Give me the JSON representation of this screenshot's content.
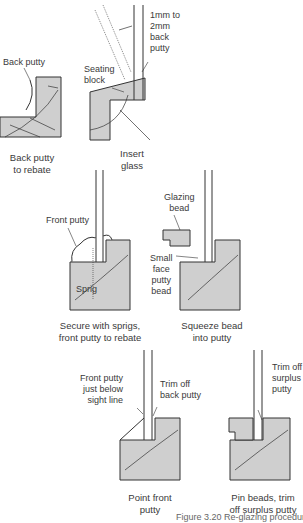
{
  "figure": {
    "caption": "Figure 3.20  Re-glazing procedure",
    "colors": {
      "timber": "#cfcfcf",
      "outline": "#333333",
      "text": "#3a3a3a"
    }
  },
  "steps": [
    {
      "id": "back-putty-to-rebate",
      "caption_line1": "Back putty",
      "caption_line2": "to rebate",
      "labels": [
        "Back putty"
      ]
    },
    {
      "id": "insert-glass",
      "caption_line1": "Insert",
      "caption_line2": "glass",
      "labels": [
        "Seating",
        "block",
        "1mm to",
        "2mm",
        "back",
        "putty"
      ]
    },
    {
      "id": "secure-with-sprigs",
      "caption_line1": "Secure with sprigs,",
      "caption_line2": "front putty to rebate",
      "labels": [
        "Front putty",
        "Sprig"
      ]
    },
    {
      "id": "squeeze-bead",
      "caption_line1": "Squeeze bead",
      "caption_line2": "into putty",
      "labels": [
        "Glazing",
        "bead",
        "Small",
        "face",
        "putty",
        "bead"
      ]
    },
    {
      "id": "point-front-putty",
      "caption_line1": "Point front",
      "caption_line2": "putty",
      "labels": [
        "Front putty",
        "just below",
        "sight line",
        "Trim off",
        "back putty"
      ]
    },
    {
      "id": "pin-beads",
      "caption_line1": "Pin beads, trim",
      "caption_line2": "off surplus putty",
      "labels": [
        "Trim off",
        "surplus",
        "putty"
      ]
    }
  ]
}
